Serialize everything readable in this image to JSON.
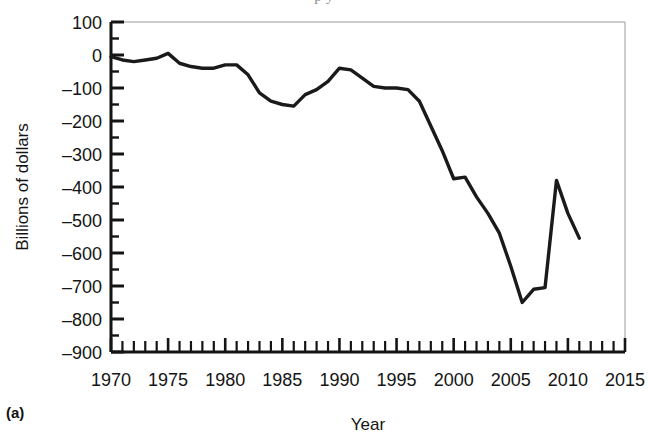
{
  "figure": {
    "panel_label": "(a)",
    "clipped_caption_fragment": "p                                   y"
  },
  "chart_data": {
    "type": "line",
    "title": "",
    "xlabel": "Year",
    "ylabel": "Billions of dollars",
    "xlim": [
      1970,
      2015
    ],
    "ylim": [
      -900,
      100
    ],
    "grid": false,
    "legend": "none",
    "y_major_step": 100,
    "y_minor_step": 50,
    "x_major_step": 5,
    "x_minor_step": 1,
    "xticks": [
      1970,
      1975,
      1980,
      1985,
      1990,
      1995,
      2000,
      2005,
      2010,
      2015
    ],
    "xtick_labels": [
      "1970",
      "1975",
      "1980",
      "1985",
      "1990",
      "1995",
      "2000",
      "2005",
      "2010",
      "2015"
    ],
    "yticks": [
      100,
      0,
      -100,
      -200,
      -300,
      -400,
      -500,
      -600,
      -700,
      -800,
      -900
    ],
    "ytick_labels": [
      "100",
      "0",
      "–100",
      "–200",
      "–300",
      "–400",
      "–500",
      "–600",
      "–700",
      "–800",
      "–900"
    ],
    "line_color": "#1a1a1a",
    "line_width": 3.4,
    "series": [
      {
        "name": "Federal budget surplus or deficit",
        "x": [
          1970,
          1971,
          1972,
          1973,
          1974,
          1975,
          1976,
          1977,
          1978,
          1979,
          1980,
          1981,
          1982,
          1983,
          1984,
          1985,
          1986,
          1987,
          1988,
          1989,
          1990,
          1991,
          1992,
          1993,
          1994,
          1995,
          1996,
          1997,
          1998,
          1999,
          2000,
          2001,
          2002,
          2003,
          2004,
          2005,
          2006,
          2007,
          2008,
          2009,
          2010,
          2011
        ],
        "values": [
          -3,
          -23,
          -23,
          -15,
          -6,
          -53,
          -74,
          -54,
          -59,
          -41,
          -74,
          -79,
          -128,
          -208,
          -185,
          -212,
          -221,
          -150,
          -155,
          -153,
          -221,
          -269,
          -290,
          -255,
          -203,
          -164,
          -107,
          -22,
          69,
          126,
          236,
          128,
          -158,
          -378,
          -413,
          -318,
          -248,
          -161,
          -459,
          -1413,
          -1294,
          -1300
        ]
      }
    ],
    "plotted_points": {
      "note": "values as read off the printed curve, billions of dollars",
      "x": [
        1970,
        1971,
        1972,
        1973,
        1974,
        1975,
        1976,
        1977,
        1978,
        1979,
        1980,
        1981,
        1982,
        1983,
        1984,
        1985,
        1986,
        1987,
        1988,
        1989,
        1990,
        1991,
        1992,
        1993,
        1994,
        1995,
        1996,
        1997,
        1998,
        1999,
        2000,
        2001,
        2002,
        2003,
        2004,
        2005,
        2006,
        2007,
        2008,
        2009,
        2010,
        2011
      ],
      "y": [
        -5,
        -15,
        -20,
        -15,
        -10,
        5,
        -25,
        -35,
        -40,
        -40,
        -30,
        -30,
        -60,
        -115,
        -140,
        -150,
        -155,
        -120,
        -105,
        -80,
        -40,
        -45,
        -70,
        -95,
        -100,
        -100,
        -105,
        -140,
        -215,
        -290,
        -375,
        -370,
        -430,
        -480,
        -540,
        -640,
        -750,
        -710,
        -705,
        -380,
        -480,
        -555
      ]
    }
  }
}
